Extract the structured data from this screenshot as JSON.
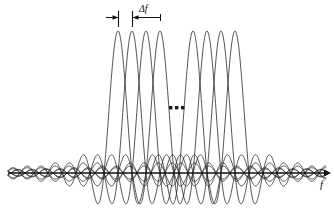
{
  "figure": {
    "axis": {
      "x_label": "f",
      "x_label_name": "frequency-axis-label",
      "baseline_y": 173,
      "start_x": 8,
      "end_x": 326,
      "arrow": "right"
    },
    "annotation": {
      "spacing_label": "Δf",
      "ellipsis": "▪▪▪",
      "ellipsis_text": "..."
    },
    "colors": {
      "curve": "#1a1a1a",
      "axis": "#111111",
      "background": "#ffffff",
      "text": "#111111"
    }
  },
  "chart_data": {
    "type": "line",
    "xlabel": "f",
    "ylabel": "",
    "grid": false,
    "legend": null,
    "annotations": [
      {
        "text": "Δf",
        "meaning": "subcarrier spacing",
        "x_from": 132,
        "x_to": 160,
        "y": 18
      },
      {
        "text": "...",
        "meaning": "omitted middle subcarriers",
        "x": 176,
        "y": 108
      }
    ],
    "subcarrier_spacing_px": 14,
    "peak_amplitude_px": 142,
    "baseline_y_px": 173,
    "series": [
      {
        "name": "subcarrier-1",
        "center_x": 118,
        "group": "left"
      },
      {
        "name": "subcarrier-2",
        "center_x": 132,
        "group": "left"
      },
      {
        "name": "subcarrier-3",
        "center_x": 146,
        "group": "left"
      },
      {
        "name": "subcarrier-4",
        "center_x": 160,
        "group": "left"
      },
      {
        "name": "subcarrier-n-3",
        "center_x": 193,
        "group": "right"
      },
      {
        "name": "subcarrier-n-2",
        "center_x": 207,
        "group": "right"
      },
      {
        "name": "subcarrier-n-1",
        "center_x": 221,
        "group": "right"
      },
      {
        "name": "subcarrier-n",
        "center_x": 235,
        "group": "right"
      }
    ],
    "x": [
      118,
      132,
      146,
      160,
      193,
      207,
      221,
      235
    ],
    "values": [
      1,
      1,
      1,
      1,
      1,
      1,
      1,
      1
    ],
    "xlim": [
      8,
      326
    ],
    "ylim": [
      -0.25,
      1.0
    ]
  }
}
